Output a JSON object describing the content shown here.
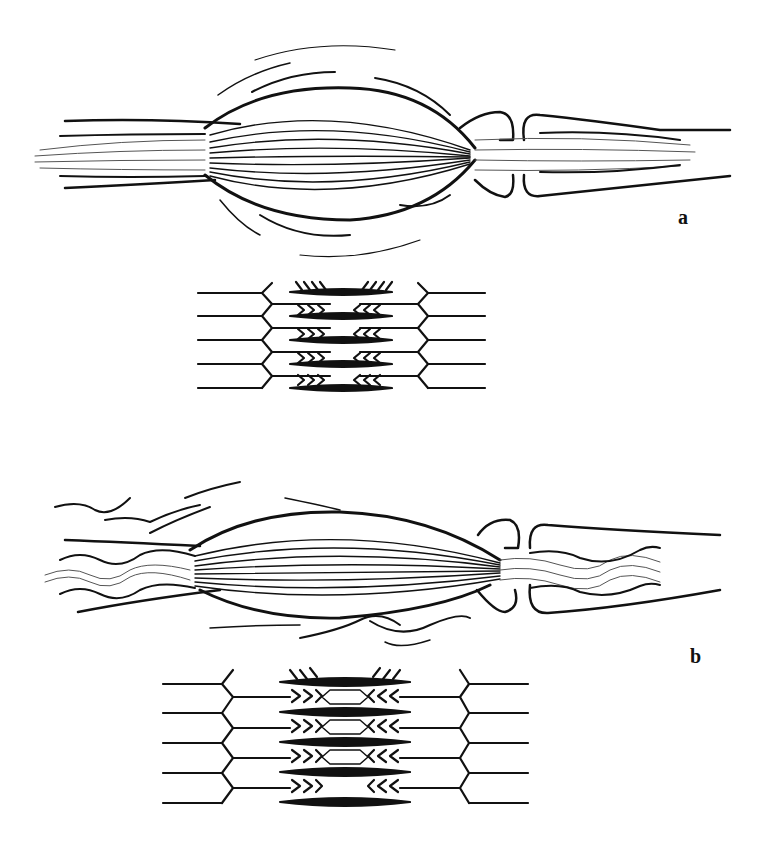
{
  "figure": {
    "panels": [
      {
        "label": "a",
        "muscle_state": "relaxed",
        "sarcomere_state": "overlapped"
      },
      {
        "label": "b",
        "muscle_state": "contracted",
        "sarcomere_state": "overlapped-wide"
      }
    ]
  },
  "colors": {
    "ink": "#111111",
    "background": "#ffffff"
  }
}
